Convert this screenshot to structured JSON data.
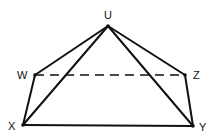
{
  "diagram": {
    "type": "geometric-figure",
    "stroke_color": "#111111",
    "points": {
      "U": {
        "label": "U",
        "x": 108,
        "y": 26
      },
      "W": {
        "label": "W",
        "x": 35,
        "y": 75
      },
      "Z": {
        "label": "Z",
        "x": 185,
        "y": 75
      },
      "X": {
        "label": "X",
        "x": 23,
        "y": 125
      },
      "Y": {
        "label": "Y",
        "x": 193,
        "y": 126
      }
    },
    "edges": [
      {
        "from": "U",
        "to": "W",
        "style": "solid"
      },
      {
        "from": "U",
        "to": "Z",
        "style": "solid"
      },
      {
        "from": "U",
        "to": "X",
        "style": "solid"
      },
      {
        "from": "U",
        "to": "Y",
        "style": "solid"
      },
      {
        "from": "W",
        "to": "X",
        "style": "solid"
      },
      {
        "from": "Z",
        "to": "Y",
        "style": "solid"
      },
      {
        "from": "X",
        "to": "Y",
        "style": "solid"
      },
      {
        "from": "W",
        "to": "Z",
        "style": "dashed"
      }
    ]
  }
}
